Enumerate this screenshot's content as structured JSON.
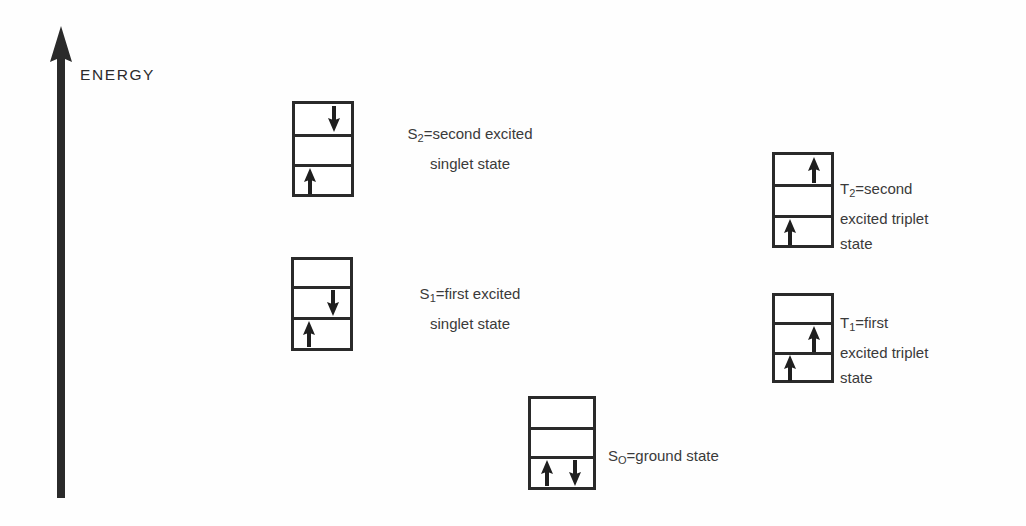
{
  "axis": {
    "label": "ENERGY",
    "direction": "up",
    "color": "#2a2a2a"
  },
  "diagram": {
    "background": "#fefefe",
    "line_color": "#2a2a2a",
    "text_color": "#3a3a3a"
  },
  "levels": [
    {
      "id": "S2",
      "symbol": "S",
      "subscript": "2",
      "caption_lines": [
        "S2=second excited",
        "singlet state"
      ],
      "caption_line1_prefix": "S",
      "caption_line1_sub": "2",
      "caption_line1_rest": "=second excited",
      "caption_line2": "singlet state",
      "align": "centered",
      "rows": [
        {
          "arrows": [
            {
              "dir": "down",
              "pos": "right"
            }
          ]
        },
        {
          "arrows": []
        },
        {
          "arrows": [
            {
              "dir": "up",
              "pos": "left"
            }
          ]
        }
      ]
    },
    {
      "id": "S1",
      "symbol": "S",
      "subscript": "1",
      "caption_lines": [
        "S1=first excited",
        "singlet state"
      ],
      "caption_line1_prefix": "S",
      "caption_line1_sub": "1",
      "caption_line1_rest": "=first excited",
      "caption_line2": "singlet state",
      "align": "centered",
      "rows": [
        {
          "arrows": []
        },
        {
          "arrows": [
            {
              "dir": "down",
              "pos": "right"
            }
          ]
        },
        {
          "arrows": [
            {
              "dir": "up",
              "pos": "left"
            }
          ]
        }
      ]
    },
    {
      "id": "S0",
      "symbol": "S",
      "subscript": "O",
      "caption_lines": [
        "SO=ground state"
      ],
      "caption_line1_prefix": "S",
      "caption_line1_sub": "O",
      "caption_line1_rest": "=ground state",
      "caption_line2": "",
      "align": "lefted",
      "rows": [
        {
          "arrows": []
        },
        {
          "arrows": []
        },
        {
          "arrows": [
            {
              "dir": "up",
              "pos": "pair-left"
            },
            {
              "dir": "down",
              "pos": "pair-right"
            }
          ]
        }
      ]
    },
    {
      "id": "T2",
      "symbol": "T",
      "subscript": "2",
      "caption_lines": [
        "T2=second",
        "excited triplet",
        "state"
      ],
      "caption_line1_prefix": "T",
      "caption_line1_sub": "2",
      "caption_line1_rest": "=second",
      "caption_line2": "excited triplet",
      "caption_line3": "state",
      "align": "lefted",
      "rows": [
        {
          "arrows": [
            {
              "dir": "up",
              "pos": "right"
            }
          ]
        },
        {
          "arrows": []
        },
        {
          "arrows": [
            {
              "dir": "up",
              "pos": "left"
            }
          ]
        }
      ]
    },
    {
      "id": "T1",
      "symbol": "T",
      "subscript": "1",
      "caption_lines": [
        "T1=first",
        "excited triplet",
        "state"
      ],
      "caption_line1_prefix": "T",
      "caption_line1_sub": "1",
      "caption_line1_rest": "=first",
      "caption_line2": "excited triplet",
      "caption_line3": "state",
      "align": "lefted",
      "rows": [
        {
          "arrows": []
        },
        {
          "arrows": [
            {
              "dir": "up",
              "pos": "right"
            }
          ]
        },
        {
          "arrows": [
            {
              "dir": "up",
              "pos": "left"
            }
          ]
        }
      ]
    }
  ]
}
